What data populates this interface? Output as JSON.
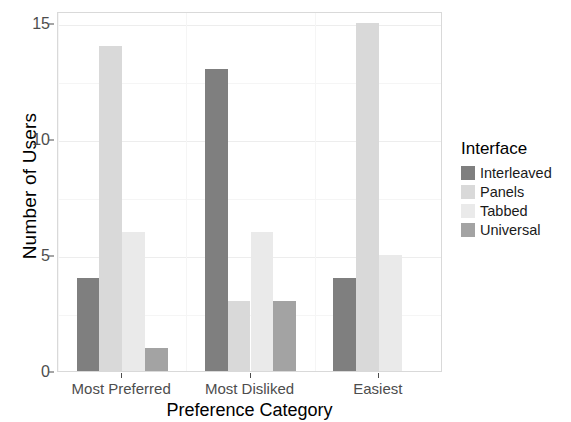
{
  "chart_data": {
    "type": "bar",
    "title": "",
    "subtitle": "",
    "xlabel": "Preference Category",
    "ylabel": "Number of Users",
    "categories": [
      "Most Preferred",
      "Most Disliked",
      "Easiest"
    ],
    "series": [
      {
        "name": "Interleaved",
        "color": "#7f7f7f",
        "values": [
          4,
          13,
          4
        ]
      },
      {
        "name": "Panels",
        "color": "#d9d9d9",
        "values": [
          14,
          3,
          15
        ]
      },
      {
        "name": "Tabbed",
        "color": "#eaeaea",
        "values": [
          6,
          6,
          5
        ]
      },
      {
        "name": "Universal",
        "color": "#a3a3a3",
        "values": [
          1,
          3,
          0
        ]
      }
    ],
    "ylim": [
      0,
      15.5
    ],
    "y_ticks": [
      0,
      5,
      10,
      15
    ],
    "y_tick_labels": [
      "0",
      "5",
      "10",
      "15"
    ],
    "y_minor_ticks": [
      2.5,
      7.5,
      12.5
    ],
    "grid": true,
    "legend": {
      "title": "Interface",
      "position": "right",
      "entries": [
        "Interleaved",
        "Panels",
        "Tabbed",
        "Universal"
      ]
    },
    "panel_background": "#ffffff",
    "grid_color": "#ededed",
    "axis_text_color": "#4d4d4d"
  }
}
